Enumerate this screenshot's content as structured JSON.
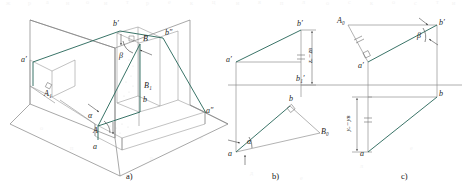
{
  "figure": {
    "type": "technical-line-drawing",
    "colors": {
      "construction_line": "#6e6e6e",
      "projection_box": "#7a7a7a",
      "highlight_line": "#2f6d60",
      "label_text": "#1d1d1d",
      "background": "#ffffff"
    },
    "captions": [
      {
        "id": "cap-a",
        "text": "a)"
      },
      {
        "id": "cap-b",
        "text": "b)"
      },
      {
        "id": "cap-c",
        "text": "c)"
      }
    ]
  },
  "panel_a": {
    "caption": "a)",
    "description": "Pictorial three-plane projection box showing segment AB with its horizontal, frontal and profile projections.",
    "labels": [
      {
        "id": "a-bp",
        "text": "b",
        "sub": "",
        "prime": "′",
        "full": "b′"
      },
      {
        "id": "a-B",
        "text": "B",
        "full": "B"
      },
      {
        "id": "a-bpp",
        "text": "b″",
        "full": "b″"
      },
      {
        "id": "a-beta",
        "text": "β",
        "full": "β"
      },
      {
        "id": "a-ap",
        "text": "a′",
        "full": "a′"
      },
      {
        "id": "a-A1",
        "text": "A",
        "sub": "1",
        "full": "A₁"
      },
      {
        "id": "a-B1",
        "text": "B",
        "sub": "1",
        "full": "B₁"
      },
      {
        "id": "a-b",
        "text": "b",
        "full": "b"
      },
      {
        "id": "a-alpha",
        "text": "α",
        "full": "α"
      },
      {
        "id": "a-A",
        "text": "A",
        "full": "A"
      },
      {
        "id": "a-a",
        "text": "a",
        "full": "a"
      },
      {
        "id": "a-app",
        "text": "a″",
        "full": "a″"
      }
    ]
  },
  "panel_b": {
    "caption": "b)",
    "description": "Orthographic two-view drawing: right-triangle method on the horizontal projection giving the true angle alpha to the H plane.",
    "labels": [
      {
        "id": "b-bp",
        "full": "b′"
      },
      {
        "id": "b-ap",
        "full": "a′"
      },
      {
        "id": "b-b1p",
        "full": "b₁′"
      },
      {
        "id": "b-b",
        "full": "b"
      },
      {
        "id": "b-B0",
        "full": "B₀"
      },
      {
        "id": "b-a",
        "full": "a"
      },
      {
        "id": "b-alpha",
        "full": "α"
      }
    ],
    "dimension": {
      "id": "b-dim",
      "full": "zₐ−zʙ",
      "text": "z",
      "sub_a": "A",
      "sub_b": "B"
    }
  },
  "panel_c": {
    "caption": "c)",
    "description": "Orthographic two-view drawing: right-triangle method on the frontal projection giving the true angle beta to the V plane.",
    "labels": [
      {
        "id": "c-A0",
        "full": "A₀"
      },
      {
        "id": "c-bp",
        "full": "b′"
      },
      {
        "id": "c-beta",
        "full": "β"
      },
      {
        "id": "c-ap",
        "full": "a′"
      },
      {
        "id": "c-b",
        "full": "b"
      },
      {
        "id": "c-a",
        "full": "a"
      }
    ],
    "dimension": {
      "id": "c-dim",
      "full": "yₐ−yʙ",
      "text": "y",
      "sub_a": "A",
      "sub_b": "B"
    }
  }
}
